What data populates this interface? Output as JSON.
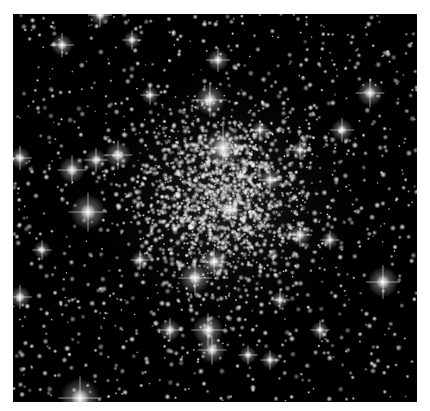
{
  "image": {
    "subject": "globular star cluster",
    "background_color": "#000000",
    "page_color": "#ffffff",
    "frame": {
      "x": 13,
      "y": 14,
      "width": 404,
      "height": 388
    },
    "cluster_center": {
      "x": 225,
      "y": 200
    },
    "cluster_core_radius": 120,
    "faint_star_count": 2600,
    "bright_stars": [
      {
        "x": 223,
        "y": 148,
        "r": 9
      },
      {
        "x": 210,
        "y": 100,
        "r": 7
      },
      {
        "x": 218,
        "y": 60,
        "r": 5
      },
      {
        "x": 88,
        "y": 212,
        "r": 8
      },
      {
        "x": 72,
        "y": 170,
        "r": 6
      },
      {
        "x": 118,
        "y": 155,
        "r": 6
      },
      {
        "x": 96,
        "y": 160,
        "r": 5
      },
      {
        "x": 20,
        "y": 158,
        "r": 5
      },
      {
        "x": 195,
        "y": 278,
        "r": 7
      },
      {
        "x": 214,
        "y": 262,
        "r": 6
      },
      {
        "x": 208,
        "y": 330,
        "r": 7
      },
      {
        "x": 212,
        "y": 350,
        "r": 6
      },
      {
        "x": 170,
        "y": 330,
        "r": 5
      },
      {
        "x": 80,
        "y": 398,
        "r": 9
      },
      {
        "x": 383,
        "y": 282,
        "r": 7
      },
      {
        "x": 370,
        "y": 93,
        "r": 6
      },
      {
        "x": 342,
        "y": 130,
        "r": 5
      },
      {
        "x": 20,
        "y": 297,
        "r": 5
      },
      {
        "x": 62,
        "y": 45,
        "r": 5
      },
      {
        "x": 100,
        "y": 15,
        "r": 5
      },
      {
        "x": 132,
        "y": 40,
        "r": 4
      },
      {
        "x": 230,
        "y": 210,
        "r": 5
      },
      {
        "x": 270,
        "y": 180,
        "r": 5
      },
      {
        "x": 300,
        "y": 235,
        "r": 5
      },
      {
        "x": 330,
        "y": 240,
        "r": 4
      },
      {
        "x": 260,
        "y": 130,
        "r": 4
      },
      {
        "x": 150,
        "y": 95,
        "r": 4
      },
      {
        "x": 280,
        "y": 300,
        "r": 4
      },
      {
        "x": 320,
        "y": 330,
        "r": 4
      },
      {
        "x": 140,
        "y": 260,
        "r": 4
      },
      {
        "x": 42,
        "y": 250,
        "r": 4
      },
      {
        "x": 300,
        "y": 150,
        "r": 4
      },
      {
        "x": 248,
        "y": 355,
        "r": 4
      },
      {
        "x": 270,
        "y": 360,
        "r": 4
      }
    ]
  }
}
